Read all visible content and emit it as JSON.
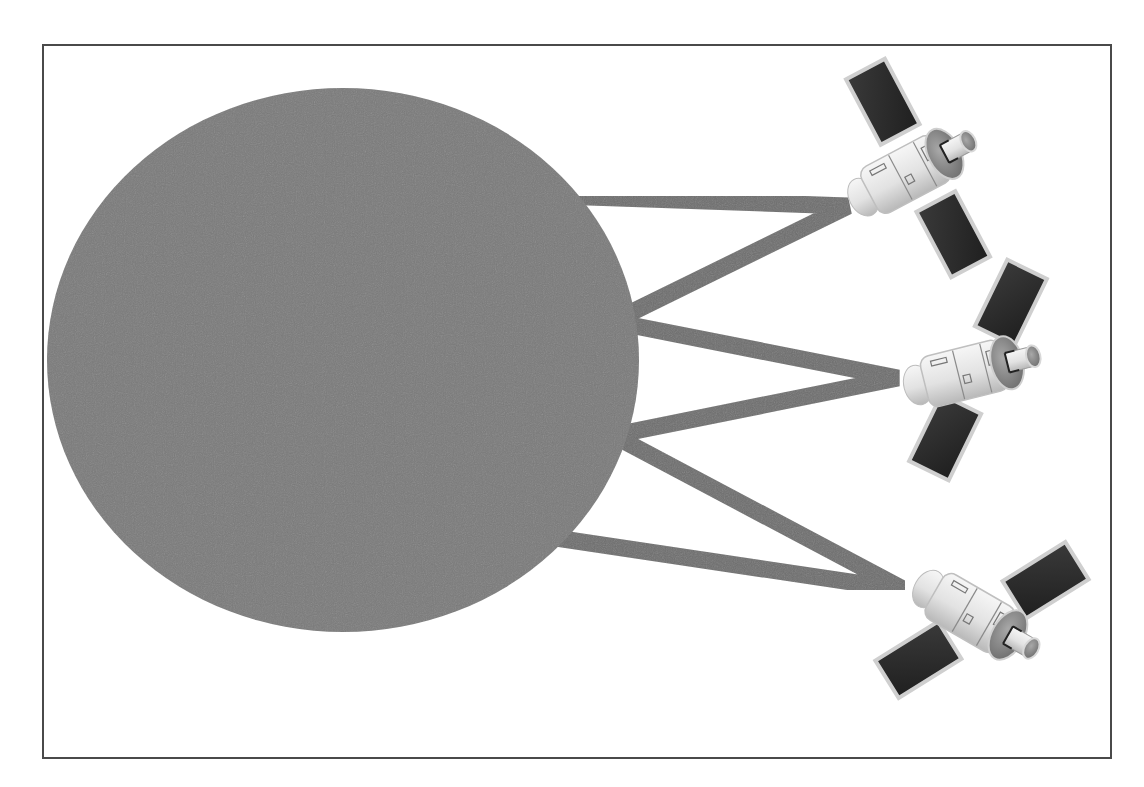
{
  "diagram": {
    "type": "planet-satellite-links",
    "frame": {
      "x": 42,
      "y": 44,
      "width": 1068,
      "height": 713,
      "stroke": "#4a4a4a"
    },
    "planet": {
      "label": "",
      "cx": 343,
      "cy": 360,
      "rx": 296,
      "ry": 272,
      "fill": "#7a7a7a"
    },
    "links": {
      "color": "#6e6e6e",
      "width": 17,
      "items": [
        {
          "from": [
            575,
            196
          ],
          "to": [
            848,
            206
          ]
        },
        {
          "from": [
            848,
            206
          ],
          "to": [
            633,
            312
          ]
        },
        {
          "from": [
            637,
            328
          ],
          "to": [
            898,
            378
          ]
        },
        {
          "from": [
            898,
            378
          ],
          "to": [
            632,
            430
          ]
        },
        {
          "from": [
            632,
            445
          ],
          "to": [
            905,
            590
          ]
        },
        {
          "from": [
            905,
            590
          ],
          "to": [
            565,
            540
          ]
        }
      ]
    },
    "satellites": [
      {
        "name": "satellite-top",
        "x": 910,
        "y": 180,
        "rotate": -28,
        "panel_rotate": 0
      },
      {
        "name": "satellite-middle",
        "x": 975,
        "y": 372,
        "rotate": -12,
        "panel_rotate": 38
      },
      {
        "name": "satellite-bottom",
        "x": 985,
        "y": 620,
        "rotate": 28,
        "panel_rotate": 55
      }
    ],
    "colors": {
      "panel_dark": "#2e2e2e",
      "panel_edge": "#c8c8c8",
      "body_light": "#e8e8e8",
      "body_mid": "#bdbdbd",
      "outline": "#6a6a6a"
    }
  }
}
